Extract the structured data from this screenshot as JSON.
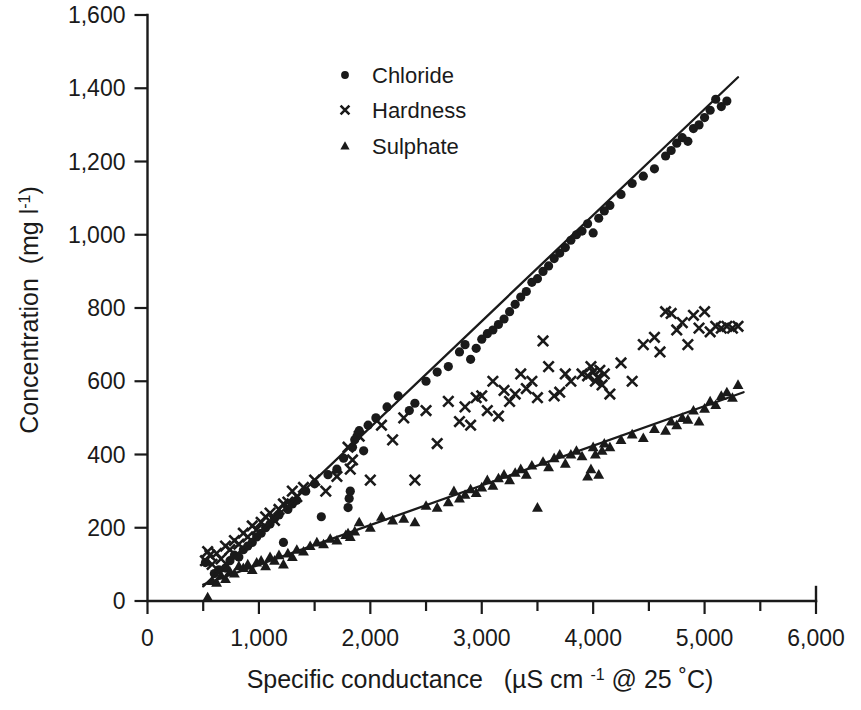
{
  "chart_data": {
    "type": "scatter",
    "title": "",
    "xlabel": "Specific conductance   (µS  cm -1 @ 25 ˚C)",
    "ylabel": "Concentration  (mg l-1)",
    "xlabel_parts": {
      "main": "Specific conductance",
      "paren_open": "(",
      "unit_mu": "µS",
      "unit_cm": "cm",
      "exp": "-1",
      "at": "@ 25 ˚C)"
    },
    "ylabel_parts": {
      "main": "Concentration",
      "unit": "(mg l",
      "exp": "-1",
      "close": ")"
    },
    "xlim": [
      0,
      6000
    ],
    "ylim": [
      0,
      1600
    ],
    "xticks": [
      0,
      500,
      1000,
      1500,
      2000,
      2500,
      3000,
      3500,
      4000,
      4500,
      5000,
      5500,
      6000
    ],
    "xticklabels": [
      "0",
      "",
      "1,000",
      "",
      "2,000",
      "",
      "3,000",
      "",
      "4,000",
      "",
      "5,000",
      "",
      "6,000"
    ],
    "yticks": [
      0,
      200,
      400,
      600,
      800,
      1000,
      1200,
      1400,
      1600
    ],
    "yticklabels": [
      "0",
      "200",
      "400",
      "600",
      "800",
      "1,000",
      "1,200",
      "1,400",
      "1,600"
    ],
    "grid": false,
    "legend_position": "upper-center-left",
    "marker_color": "#1a1a1a",
    "series": [
      {
        "name": "Chloride",
        "marker": "circle",
        "legend_label": "Chloride",
        "fit_line": {
          "x": [
            500,
            5300
          ],
          "y": [
            40,
            1430
          ]
        },
        "points": [
          [
            520,
            105
          ],
          [
            600,
            75
          ],
          [
            640,
            85
          ],
          [
            700,
            90
          ],
          [
            740,
            110
          ],
          [
            780,
            125
          ],
          [
            820,
            120
          ],
          [
            860,
            140
          ],
          [
            900,
            150
          ],
          [
            940,
            160
          ],
          [
            980,
            175
          ],
          [
            1020,
            185
          ],
          [
            1060,
            200
          ],
          [
            1100,
            210
          ],
          [
            1140,
            225
          ],
          [
            1180,
            235
          ],
          [
            1220,
            160
          ],
          [
            1260,
            250
          ],
          [
            1300,
            265
          ],
          [
            1340,
            275
          ],
          [
            1420,
            300
          ],
          [
            1500,
            320
          ],
          [
            1560,
            230
          ],
          [
            1620,
            345
          ],
          [
            1700,
            360
          ],
          [
            1760,
            390
          ],
          [
            1800,
            255
          ],
          [
            1810,
            280
          ],
          [
            1820,
            300
          ],
          [
            1840,
            420
          ],
          [
            1860,
            440
          ],
          [
            1880,
            450
          ],
          [
            1900,
            465
          ],
          [
            1940,
            410
          ],
          [
            1980,
            480
          ],
          [
            2050,
            500
          ],
          [
            2150,
            530
          ],
          [
            2250,
            560
          ],
          [
            2350,
            520
          ],
          [
            2400,
            540
          ],
          [
            2500,
            600
          ],
          [
            2600,
            625
          ],
          [
            2700,
            640
          ],
          [
            2800,
            680
          ],
          [
            2850,
            700
          ],
          [
            2900,
            660
          ],
          [
            2950,
            690
          ],
          [
            3000,
            715
          ],
          [
            3050,
            730
          ],
          [
            3100,
            740
          ],
          [
            3150,
            755
          ],
          [
            3200,
            770
          ],
          [
            3250,
            790
          ],
          [
            3300,
            810
          ],
          [
            3350,
            830
          ],
          [
            3400,
            845
          ],
          [
            3450,
            870
          ],
          [
            3500,
            880
          ],
          [
            3550,
            900
          ],
          [
            3600,
            915
          ],
          [
            3650,
            935
          ],
          [
            3700,
            950
          ],
          [
            3750,
            965
          ],
          [
            3800,
            985
          ],
          [
            3850,
            1000
          ],
          [
            3900,
            1010
          ],
          [
            3950,
            1030
          ],
          [
            4000,
            1005
          ],
          [
            4050,
            1045
          ],
          [
            4100,
            1065
          ],
          [
            4150,
            1080
          ],
          [
            4250,
            1110
          ],
          [
            4350,
            1140
          ],
          [
            4450,
            1160
          ],
          [
            4550,
            1180
          ],
          [
            4650,
            1215
          ],
          [
            4700,
            1230
          ],
          [
            4750,
            1250
          ],
          [
            4800,
            1265
          ],
          [
            4850,
            1255
          ],
          [
            4900,
            1290
          ],
          [
            4950,
            1300
          ],
          [
            5000,
            1320
          ],
          [
            5050,
            1340
          ],
          [
            5100,
            1370
          ],
          [
            5150,
            1350
          ],
          [
            5200,
            1365
          ]
        ]
      },
      {
        "name": "Hardness",
        "marker": "cross",
        "legend_label": "Hardness",
        "fit_line": null,
        "points": [
          [
            520,
            110
          ],
          [
            540,
            135
          ],
          [
            560,
            125
          ],
          [
            580,
            100
          ],
          [
            620,
            130
          ],
          [
            660,
            115
          ],
          [
            700,
            150
          ],
          [
            740,
            140
          ],
          [
            780,
            165
          ],
          [
            820,
            155
          ],
          [
            860,
            185
          ],
          [
            900,
            175
          ],
          [
            940,
            205
          ],
          [
            980,
            195
          ],
          [
            1020,
            215
          ],
          [
            1060,
            230
          ],
          [
            1100,
            240
          ],
          [
            1140,
            220
          ],
          [
            1180,
            250
          ],
          [
            1220,
            265
          ],
          [
            1260,
            270
          ],
          [
            1300,
            300
          ],
          [
            1340,
            285
          ],
          [
            1400,
            310
          ],
          [
            1500,
            330
          ],
          [
            1600,
            300
          ],
          [
            1700,
            340
          ],
          [
            1800,
            420
          ],
          [
            1820,
            360
          ],
          [
            1840,
            385
          ],
          [
            1900,
            450
          ],
          [
            2000,
            330
          ],
          [
            2100,
            480
          ],
          [
            2200,
            440
          ],
          [
            2300,
            500
          ],
          [
            2400,
            330
          ],
          [
            2500,
            520
          ],
          [
            2600,
            430
          ],
          [
            2700,
            545
          ],
          [
            2800,
            490
          ],
          [
            2850,
            530
          ],
          [
            2900,
            480
          ],
          [
            2950,
            555
          ],
          [
            3000,
            560
          ],
          [
            3050,
            520
          ],
          [
            3100,
            600
          ],
          [
            3150,
            505
          ],
          [
            3200,
            575
          ],
          [
            3250,
            545
          ],
          [
            3300,
            565
          ],
          [
            3350,
            620
          ],
          [
            3400,
            580
          ],
          [
            3450,
            600
          ],
          [
            3500,
            555
          ],
          [
            3550,
            710
          ],
          [
            3600,
            640
          ],
          [
            3650,
            560
          ],
          [
            3700,
            570
          ],
          [
            3750,
            620
          ],
          [
            3800,
            600
          ],
          [
            3900,
            620
          ],
          [
            3950,
            615
          ],
          [
            3980,
            640
          ],
          [
            4000,
            625
          ],
          [
            4020,
            600
          ],
          [
            4040,
            610
          ],
          [
            4060,
            630
          ],
          [
            4080,
            590
          ],
          [
            4100,
            620
          ],
          [
            4150,
            565
          ],
          [
            4250,
            650
          ],
          [
            4350,
            600
          ],
          [
            4450,
            700
          ],
          [
            4550,
            720
          ],
          [
            4600,
            680
          ],
          [
            4650,
            790
          ],
          [
            4700,
            785
          ],
          [
            4750,
            740
          ],
          [
            4800,
            760
          ],
          [
            4850,
            700
          ],
          [
            4900,
            780
          ],
          [
            4950,
            745
          ],
          [
            5000,
            790
          ],
          [
            5050,
            735
          ],
          [
            5100,
            750
          ],
          [
            5150,
            745
          ],
          [
            5200,
            750
          ],
          [
            5250,
            745
          ],
          [
            5300,
            750
          ]
        ]
      },
      {
        "name": "Sulphate",
        "marker": "triangle",
        "legend_label": "Sulphate",
        "fit_line": {
          "x": [
            500,
            5350
          ],
          "y": [
            45,
            570
          ]
        },
        "points": [
          [
            540,
            10
          ],
          [
            580,
            55
          ],
          [
            620,
            50
          ],
          [
            660,
            70
          ],
          [
            700,
            60
          ],
          [
            740,
            80
          ],
          [
            780,
            75
          ],
          [
            820,
            95
          ],
          [
            860,
            90
          ],
          [
            900,
            100
          ],
          [
            940,
            85
          ],
          [
            980,
            105
          ],
          [
            1020,
            110
          ],
          [
            1060,
            95
          ],
          [
            1100,
            120
          ],
          [
            1140,
            110
          ],
          [
            1180,
            125
          ],
          [
            1220,
            100
          ],
          [
            1260,
            130
          ],
          [
            1300,
            120
          ],
          [
            1340,
            140
          ],
          [
            1400,
            135
          ],
          [
            1460,
            150
          ],
          [
            1520,
            160
          ],
          [
            1580,
            155
          ],
          [
            1640,
            170
          ],
          [
            1700,
            165
          ],
          [
            1780,
            180
          ],
          [
            1800,
            185
          ],
          [
            1820,
            175
          ],
          [
            1860,
            190
          ],
          [
            1900,
            215
          ],
          [
            2000,
            200
          ],
          [
            2100,
            230
          ],
          [
            2200,
            220
          ],
          [
            2300,
            225
          ],
          [
            2400,
            215
          ],
          [
            2500,
            260
          ],
          [
            2600,
            255
          ],
          [
            2700,
            270
          ],
          [
            2750,
            300
          ],
          [
            2800,
            280
          ],
          [
            2850,
            290
          ],
          [
            2900,
            305
          ],
          [
            2950,
            295
          ],
          [
            3000,
            310
          ],
          [
            3050,
            330
          ],
          [
            3100,
            315
          ],
          [
            3150,
            335
          ],
          [
            3200,
            345
          ],
          [
            3250,
            330
          ],
          [
            3300,
            350
          ],
          [
            3350,
            360
          ],
          [
            3400,
            345
          ],
          [
            3450,
            370
          ],
          [
            3500,
            255
          ],
          [
            3550,
            380
          ],
          [
            3600,
            365
          ],
          [
            3650,
            390
          ],
          [
            3700,
            400
          ],
          [
            3750,
            375
          ],
          [
            3800,
            400
          ],
          [
            3850,
            410
          ],
          [
            3900,
            395
          ],
          [
            3950,
            340
          ],
          [
            3980,
            360
          ],
          [
            4000,
            420
          ],
          [
            4020,
            400
          ],
          [
            4050,
            345
          ],
          [
            4080,
            410
          ],
          [
            4100,
            430
          ],
          [
            4150,
            420
          ],
          [
            4250,
            440
          ],
          [
            4350,
            455
          ],
          [
            4450,
            445
          ],
          [
            4550,
            470
          ],
          [
            4650,
            465
          ],
          [
            4700,
            490
          ],
          [
            4750,
            480
          ],
          [
            4800,
            500
          ],
          [
            4850,
            495
          ],
          [
            4900,
            520
          ],
          [
            4950,
            490
          ],
          [
            5000,
            525
          ],
          [
            5050,
            545
          ],
          [
            5100,
            535
          ],
          [
            5150,
            560
          ],
          [
            5200,
            570
          ],
          [
            5250,
            555
          ],
          [
            5300,
            590
          ]
        ]
      }
    ]
  },
  "legend": {
    "items": [
      {
        "label": "Chloride",
        "marker": "circle"
      },
      {
        "label": "Hardness",
        "marker": "cross"
      },
      {
        "label": "Sulphate",
        "marker": "triangle"
      }
    ]
  }
}
